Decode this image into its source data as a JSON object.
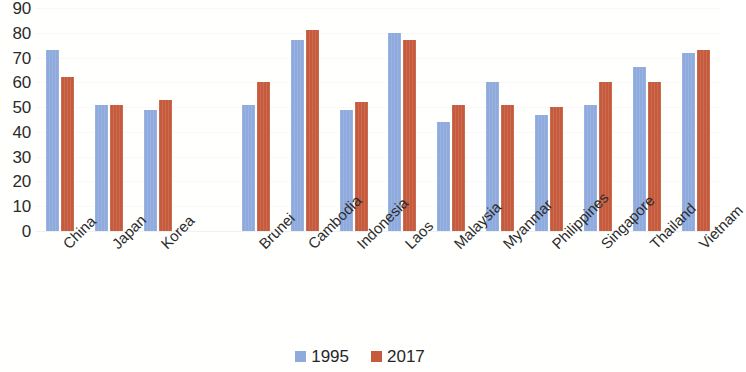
{
  "chart_data": {
    "type": "bar",
    "title": "",
    "subtitle": "",
    "xlabel": "",
    "ylabel": "",
    "ylim": [
      0,
      90
    ],
    "ytick_step": 10,
    "yticks": [
      "90",
      "80",
      "70",
      "60",
      "50",
      "40",
      "30",
      "20",
      "10",
      "0"
    ],
    "grid": true,
    "grid_orientation": "horizontal",
    "legend_position": "bottom-center",
    "categories": [
      "China",
      "Japan",
      "Korea",
      "",
      "Brunei",
      "Cambodia",
      "Indonesia",
      "Laos",
      "Malaysia",
      "Myanmar",
      "Philippines",
      "Singapore",
      "Thailand",
      "Vietnam"
    ],
    "series": [
      {
        "name": "1995",
        "color": "#8faadc",
        "values": [
          73,
          51,
          49,
          null,
          51,
          77,
          49,
          80,
          44,
          60,
          47,
          51,
          66,
          72
        ]
      },
      {
        "name": "2017",
        "color": "#c55a3c",
        "values": [
          62,
          51,
          53,
          null,
          60,
          81,
          52,
          77,
          51,
          51,
          50,
          60,
          60,
          73
        ]
      }
    ]
  },
  "legend": {
    "items": [
      {
        "label": "1995",
        "color": "#8faadc",
        "swatch": "square-swatch-icon"
      },
      {
        "label": "2017",
        "color": "#c55a3c",
        "swatch": "square-swatch-icon"
      }
    ]
  },
  "colors": {
    "series_1995": "#8faadc",
    "series_2017": "#c55a3c",
    "gridline": "#f2f4f8",
    "text": "#262626",
    "background": "#ffffff"
  }
}
